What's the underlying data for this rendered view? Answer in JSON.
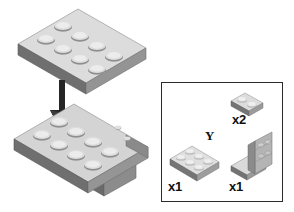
{
  "document": {
    "title": "LEGO assembly step diagram",
    "background_color": "#ffffff"
  },
  "assembly": {
    "arrow": {
      "name": "assembly-direction-arrow",
      "direction": "down",
      "color": "#262626"
    },
    "top_part": {
      "name": "plate-2x4",
      "description": "2x4 plate, 8 studs, isometric",
      "studs": 8,
      "top_color": "#d8d8d8",
      "side_color": "#8e8e8e",
      "front_color": "#6e6e6e"
    },
    "bottom_part": {
      "name": "bracket-assembly",
      "description": "plate with downward bracket",
      "studs": 8,
      "top_color": "#d2d2d2",
      "side_color": "#8a8a8a",
      "front_color": "#707070"
    }
  },
  "parts_box": {
    "name": "parts-inventory-box",
    "border_color": "#2b2b2b",
    "group_label": "Y",
    "parts": [
      {
        "name": "part-plate-1x2",
        "label": "x2",
        "studs": 2,
        "description": "1x2 plate"
      },
      {
        "name": "part-plate-2x4",
        "label": "x1",
        "studs": 8,
        "description": "2x4 plate"
      },
      {
        "name": "part-bracket",
        "label": "x1",
        "studs": 0,
        "description": "angled bracket with vertical wall"
      }
    ]
  },
  "colors": {
    "ink": "#111111",
    "brick_light": "#e2e2e2",
    "brick_mid": "#b8b8b8",
    "brick_dark": "#7a7a7a",
    "brick_shadow": "#5f5f5f"
  }
}
